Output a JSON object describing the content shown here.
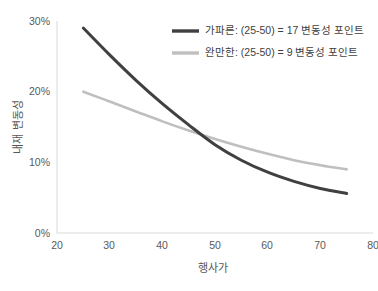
{
  "chart_data": {
    "type": "line",
    "title": "",
    "xlabel": "행사가",
    "ylabel": "내재 변동성",
    "xlim": [
      20,
      80
    ],
    "ylim": [
      0,
      0.3
    ],
    "xticks": [
      "20",
      "30",
      "40",
      "50",
      "60",
      "70",
      "80"
    ],
    "xtick_values": [
      20,
      30,
      40,
      50,
      60,
      70,
      80
    ],
    "yticks": [
      "0%",
      "10%",
      "20%",
      "30%"
    ],
    "ytick_values": [
      0,
      0.1,
      0.2,
      0.3
    ],
    "grid": false,
    "legend_position": "upper-right",
    "series": [
      {
        "name": "가파른: (25-50) = 17 변동성 포인트",
        "color": "#404040",
        "width": 3,
        "x": [
          25,
          30,
          35,
          40,
          45,
          50,
          55,
          60,
          65,
          70,
          75
        ],
        "values": [
          0.29,
          0.252,
          0.216,
          0.183,
          0.153,
          0.125,
          0.103,
          0.086,
          0.073,
          0.063,
          0.056
        ]
      },
      {
        "name": "완만한: (25-50) = 9 변동성 포인트",
        "color": "#bfbfbf",
        "width": 2.6,
        "x": [
          25,
          30,
          35,
          40,
          45,
          50,
          55,
          60,
          65,
          70,
          75
        ],
        "values": [
          0.2,
          0.186,
          0.172,
          0.158,
          0.145,
          0.133,
          0.122,
          0.112,
          0.103,
          0.096,
          0.09
        ]
      }
    ],
    "annotations": [
      "가파른 곡선은 25에서 50 사이 17 변동성 포인트 하락",
      "완만한 곡선은 25에서 50 사이 9 변동성 포인트 하락"
    ]
  },
  "legend": {
    "entries": [
      {
        "label": "가파른: (25-50) = 17 변동성 포인트",
        "color": "#404040"
      },
      {
        "label": "완만한: (25-50) = 9 변동성 포인트",
        "color": "#bfbfbf"
      }
    ]
  },
  "axes": {
    "x_title": "행사가",
    "y_title": "내재 변동성"
  },
  "colors": {
    "steep_line": "#404040",
    "gentle_line": "#bfbfbf",
    "axis": "#d9d9d9",
    "tick_text": "#595959",
    "background": "#ffffff"
  }
}
